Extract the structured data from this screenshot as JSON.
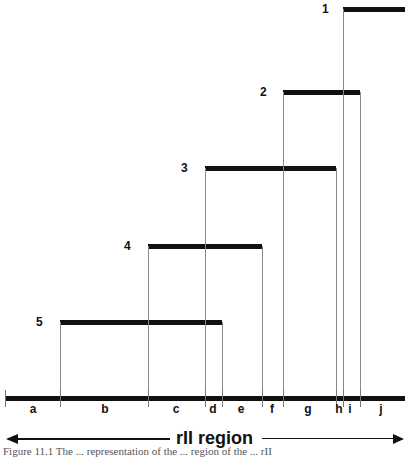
{
  "figure": {
    "deletions": [
      {
        "label": "1",
        "x_start": 343,
        "x_end": 405,
        "y": 7,
        "label_x": 322
      },
      {
        "label": "2",
        "x_start": 283,
        "x_end": 360,
        "y": 90,
        "label_x": 260
      },
      {
        "label": "3",
        "x_start": 205,
        "x_end": 336,
        "y": 166,
        "label_x": 181
      },
      {
        "label": "4",
        "x_start": 148,
        "x_end": 262,
        "y": 244,
        "label_x": 124
      },
      {
        "label": "5",
        "x_start": 60,
        "x_end": 222,
        "y": 320,
        "label_x": 36
      }
    ],
    "segments": [
      {
        "label": "a",
        "x": 33
      },
      {
        "label": "b",
        "x": 105
      },
      {
        "label": "c",
        "x": 176
      },
      {
        "label": "d",
        "x": 213
      },
      {
        "label": "e",
        "x": 241
      },
      {
        "label": "f",
        "x": 272
      },
      {
        "label": "g",
        "x": 308
      },
      {
        "label": "h",
        "x": 339
      },
      {
        "label": "i",
        "x": 350
      },
      {
        "label": "j",
        "x": 381
      }
    ],
    "boundaries": [
      5,
      60,
      148,
      205,
      222,
      262,
      283,
      336,
      343,
      360
    ],
    "region_label": "rII region",
    "caption_fragment": "Figure 11.1 The ... representation of the ... region of the ... rII"
  }
}
